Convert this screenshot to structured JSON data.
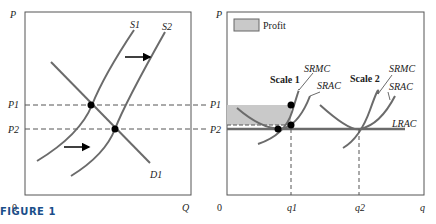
{
  "figure_label": "FIGURE 1",
  "colors": {
    "curve": "#6b6b6b",
    "axis": "#555555",
    "profit_fill": "#c9c9c9",
    "dash": "#555555",
    "dot": "#000000",
    "arrow": "#000000",
    "figure_label": "#1a4e8a"
  },
  "left_panel": {
    "y_axis_label": "P",
    "x_axis_label": "Q",
    "origin_label": "0",
    "price_labels": [
      "P1",
      "P2"
    ],
    "curves": {
      "supply1": "S1",
      "supply2": "S2",
      "demand": "D1"
    }
  },
  "right_panel": {
    "y_axis_label": "P",
    "x_axis_label": "q",
    "origin_label": "0",
    "price_labels": [
      "P1",
      "P2"
    ],
    "quantity_labels": [
      "q1",
      "q2"
    ],
    "legend": {
      "label": "Profit"
    },
    "scale1": {
      "title": "Scale 1",
      "mc_label": "SRMC",
      "ac_label": "SRAC"
    },
    "scale2": {
      "title": "Scale 2",
      "mc_label": "SRMC",
      "ac_label": "SRAC"
    },
    "lrac_label": "LRAC"
  }
}
